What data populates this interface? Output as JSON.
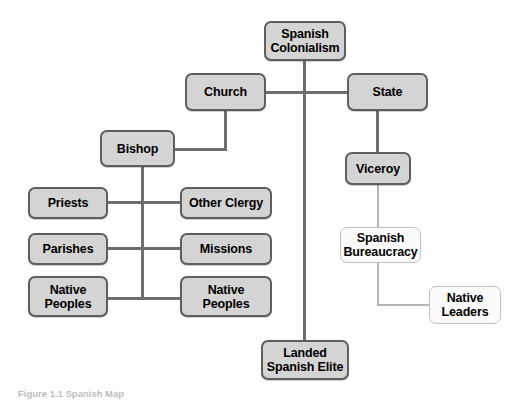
{
  "figure": {
    "title": "Spanish Colonialism",
    "caption": "Figure 1.1  Spanish Map",
    "top_cropped_text": "",
    "colors": {
      "box_fill": "#d4d4d4",
      "box_border": "#5e5e5e",
      "outline_box_fill": "#fbfbfb",
      "outline_box_border": "#c0c0c0",
      "connector": "#6e6e6e",
      "connector_light": "#b5b5b5",
      "text": "#000000",
      "background": "#ffffff"
    }
  },
  "nodes": {
    "spanish_colonialism": {
      "label": "Spanish\nColonialism",
      "style": "solid"
    },
    "church": {
      "label": "Church",
      "style": "solid"
    },
    "state": {
      "label": "State",
      "style": "solid"
    },
    "bishop": {
      "label": "Bishop",
      "style": "solid"
    },
    "viceroy": {
      "label": "Viceroy",
      "style": "solid"
    },
    "priests": {
      "label": "Priests",
      "style": "solid"
    },
    "other_clergy": {
      "label": "Other Clergy",
      "style": "solid"
    },
    "parishes": {
      "label": "Parishes",
      "style": "solid"
    },
    "missions": {
      "label": "Missions",
      "style": "solid"
    },
    "native_peoples_left": {
      "label": "Native\nPeoples",
      "style": "solid"
    },
    "native_peoples_right": {
      "label": "Native\nPeoples",
      "style": "solid"
    },
    "spanish_bureaucracy": {
      "label": "Spanish\nBureaucracy",
      "style": "outline"
    },
    "native_leaders": {
      "label": "Native\nLeaders",
      "style": "outline"
    },
    "landed_spanish_elite": {
      "label": "Landed\nSpanish Elite",
      "style": "solid"
    }
  },
  "edges": [
    {
      "from": "spanish_colonialism",
      "to": "church"
    },
    {
      "from": "spanish_colonialism",
      "to": "state"
    },
    {
      "from": "spanish_colonialism",
      "to": "landed_spanish_elite"
    },
    {
      "from": "church",
      "to": "bishop"
    },
    {
      "from": "bishop",
      "to": "priests"
    },
    {
      "from": "bishop",
      "to": "other_clergy"
    },
    {
      "from": "bishop",
      "to": "parishes"
    },
    {
      "from": "bishop",
      "to": "missions"
    },
    {
      "from": "bishop",
      "to": "native_peoples_left"
    },
    {
      "from": "bishop",
      "to": "native_peoples_right"
    },
    {
      "from": "state",
      "to": "viceroy"
    },
    {
      "from": "viceroy",
      "to": "spanish_bureaucracy"
    },
    {
      "from": "spanish_bureaucracy",
      "to": "native_leaders"
    }
  ]
}
